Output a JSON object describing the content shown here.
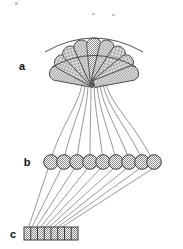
{
  "figure": {
    "title": "",
    "width": 183,
    "height": 249,
    "background_color": "#ffffff",
    "outline_color": "#4a4a4a",
    "fill_color": "#b0b0b0",
    "fill_style": "checkerboard-stipple"
  },
  "labels": {
    "a": "a",
    "b": "b",
    "c": "c"
  },
  "parts": [
    {
      "key": "a",
      "label": "a",
      "name": "fan-shaped-lobed-structure",
      "shape": "radiating-petal-fan",
      "element_count": 9,
      "fill": "stippled-gray",
      "label_x": 22,
      "label_y": 70
    },
    {
      "key": "b",
      "label": "b",
      "name": "circle-chain-row",
      "shape": "row-of-linked-circles",
      "element_count": 8,
      "fill": "stippled-gray",
      "label_x": 27,
      "label_y": 162
    },
    {
      "key": "c",
      "label": "c",
      "name": "segmented-bar",
      "shape": "horizontal-segmented-rectangle",
      "element_count": 8,
      "fill": "stippled-gray",
      "label_x": 13,
      "label_y": 235
    }
  ],
  "connections": [
    {
      "name": "a-to-b-bundle",
      "from": "a",
      "to": "b",
      "style": "curved-converging-bundle",
      "line_count": 9
    },
    {
      "name": "b-to-c-bundle",
      "from": "b",
      "to": "c",
      "style": "straight-converging-lines",
      "line_count": 8
    }
  ],
  "fan_petals": [
    {
      "index": 0,
      "angle_deg": -74
    },
    {
      "index": 1,
      "angle_deg": -56
    },
    {
      "index": 2,
      "angle_deg": -38
    },
    {
      "index": 3,
      "angle_deg": -19
    },
    {
      "index": 4,
      "angle_deg": 0
    },
    {
      "index": 5,
      "angle_deg": 19
    },
    {
      "index": 6,
      "angle_deg": 38
    },
    {
      "index": 7,
      "angle_deg": 56
    },
    {
      "index": 8,
      "angle_deg": 74
    }
  ]
}
